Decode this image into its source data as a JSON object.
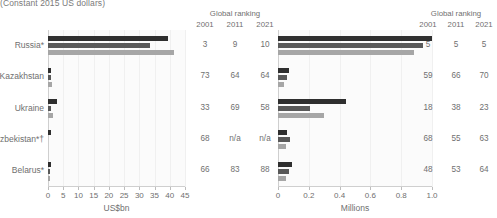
{
  "subtitle": "(Constant 2015 US dollars)",
  "ranking_header": {
    "title": "Global ranking",
    "years": [
      "2001",
      "2011",
      "2021"
    ]
  },
  "categories": [
    "Russia*",
    "Kazakhstan",
    "Ukraine",
    "Uzbekistan*†",
    "Belarus*"
  ],
  "chart_data": [
    {
      "type": "bar",
      "orientation": "horizontal",
      "title": "(Constant 2015 US dollars)",
      "xlabel": "US$bn",
      "ylabel": "",
      "xlim": [
        0,
        45
      ],
      "xticks": [
        0,
        5,
        10,
        15,
        20,
        25,
        30,
        35,
        40,
        45
      ],
      "ticklabels": [
        "0",
        "5",
        "10",
        "15",
        "20",
        "25",
        "30",
        "35",
        "40",
        "45"
      ],
      "grid": true,
      "categories": [
        "Russia*",
        "Kazakhstan",
        "Ukraine",
        "Uzbekistan*†",
        "Belarus*"
      ],
      "series": [
        {
          "name": "2001",
          "color": "#2f2f2f",
          "values": [
            39.5,
            1.0,
            3.0,
            1.0,
            1.1
          ]
        },
        {
          "name": "2011",
          "color": "#595959",
          "values": [
            33.5,
            0.9,
            0.9,
            null,
            0.5
          ]
        },
        {
          "name": "2021",
          "color": "#a6a6a6",
          "values": [
            41.5,
            1.2,
            1.6,
            null,
            0.5
          ]
        }
      ],
      "rankings": {
        "title": "Global ranking",
        "columns": [
          "2001",
          "2011",
          "2021"
        ],
        "rows": [
          [
            "3",
            "9",
            "10"
          ],
          [
            "73",
            "64",
            "64"
          ],
          [
            "33",
            "69",
            "58"
          ],
          [
            "68",
            "n/a",
            "n/a"
          ],
          [
            "66",
            "83",
            "88"
          ]
        ]
      }
    },
    {
      "type": "bar",
      "orientation": "horizontal",
      "title": "",
      "xlabel": "Millions",
      "ylabel": "",
      "xlim": [
        0,
        1.0
      ],
      "xticks": [
        0,
        0.2,
        0.4,
        0.6,
        0.8,
        1.0
      ],
      "ticklabels": [
        "0",
        "0.2",
        "0.4",
        "0.6",
        "0.8",
        "1.0"
      ],
      "grid": true,
      "categories": [
        "Russia*",
        "Kazakhstan",
        "Ukraine",
        "Uzbekistan*†",
        "Belarus*"
      ],
      "series": [
        {
          "name": "2001",
          "color": "#2f2f2f",
          "values": [
            1.0,
            0.07,
            0.44,
            0.06,
            0.09
          ]
        },
        {
          "name": "2011",
          "color": "#595959",
          "values": [
            0.94,
            0.06,
            0.21,
            0.08,
            0.07
          ]
        },
        {
          "name": "2021",
          "color": "#a6a6a6",
          "values": [
            0.88,
            0.04,
            0.3,
            0.05,
            0.05
          ]
        }
      ],
      "rankings": {
        "title": "Global ranking",
        "columns": [
          "2001",
          "2011",
          "2021"
        ],
        "rows": [
          [
            "5",
            "5",
            "5"
          ],
          [
            "59",
            "66",
            "70"
          ],
          [
            "18",
            "38",
            "23"
          ],
          [
            "68",
            "55",
            "63"
          ],
          [
            "48",
            "53",
            "64"
          ]
        ]
      }
    }
  ]
}
